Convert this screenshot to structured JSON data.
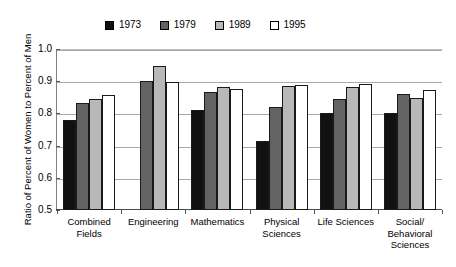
{
  "chart_data": {
    "type": "bar",
    "title": "",
    "subtitle": "",
    "xlabel": "",
    "ylabel": "Ratio of Percent of Women to Percent of Men",
    "ylim": [
      0.5,
      1.0
    ],
    "ytick_labels": [
      "1.0",
      "0.9",
      "0.8",
      "0.7",
      "0.6",
      "0.5"
    ],
    "ytick_values": [
      1.0,
      0.9,
      0.8,
      0.7,
      0.6,
      0.5
    ],
    "grid": true,
    "legend_position": "top-center",
    "categories": [
      "Combined\nFields",
      "Engineering",
      "Mathematics",
      "Physical\nSciences",
      "Life Sciences",
      "Social/\nBehavioral\nSciences"
    ],
    "series": [
      {
        "name": "1973",
        "color": "#111111",
        "values": [
          0.78,
          null,
          0.81,
          0.715,
          0.8,
          0.802
        ]
      },
      {
        "name": "1979",
        "color": "#636363",
        "values": [
          0.831,
          0.901,
          0.866,
          0.819,
          0.844,
          0.859
        ]
      },
      {
        "name": "1989",
        "color": "#b8b8b8",
        "values": [
          0.845,
          0.948,
          0.881,
          0.886,
          0.881,
          0.848
        ]
      },
      {
        "name": "1995",
        "color": "#ffffff",
        "values": [
          0.857,
          0.899,
          0.877,
          0.889,
          0.892,
          0.873
        ]
      }
    ]
  },
  "legend": {
    "items": [
      {
        "label": "1973",
        "color": "#111111"
      },
      {
        "label": "1979",
        "color": "#636363"
      },
      {
        "label": "1989",
        "color": "#b8b8b8"
      },
      {
        "label": "1995",
        "color": "#ffffff"
      }
    ]
  },
  "axis": {
    "y_title": "Ratio of Percent of Women to Percent of Men"
  }
}
